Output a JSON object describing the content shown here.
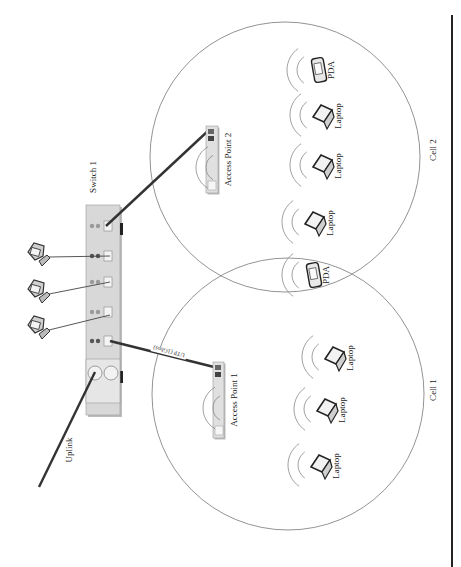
{
  "diagram": {
    "type": "network-topology",
    "orientation": "rotated-90-clockwise",
    "colors": {
      "background": "#ffffff",
      "device_fill": "#d8d8d8",
      "device_stroke": "#999999",
      "cable_thick": "#333333",
      "cable_thin": "#444444",
      "cell_outline": "#777777",
      "wave": "#888888",
      "divider": "#222222"
    },
    "switch": {
      "label": "Switch 1",
      "x": 86,
      "y": 205,
      "w": 34,
      "h": 210
    },
    "uplink": {
      "label": "Uplink",
      "x1": 95,
      "y1": 372,
      "x2": 39,
      "y2": 487
    },
    "access_points": [
      {
        "id": "ap2",
        "label": "Access Point 2",
        "x": 206,
        "y": 126,
        "w": 12,
        "h": 67
      },
      {
        "id": "ap1",
        "label": "Access Point 1",
        "x": 213,
        "y": 362,
        "w": 11,
        "h": 76
      }
    ],
    "cables": [
      {
        "id": "switch-ap2",
        "label": "",
        "x1": 106,
        "y1": 226,
        "x2": 209,
        "y2": 130
      },
      {
        "id": "switch-ap1",
        "label": "UTP (1Gbps)",
        "x1": 110,
        "y1": 341,
        "x2": 218,
        "y2": 368
      }
    ],
    "computers": [
      {
        "id": "pc1",
        "x": 37,
        "y": 255,
        "port_y": 256
      },
      {
        "id": "pc2",
        "x": 37,
        "y": 292,
        "port_y": 282
      },
      {
        "id": "pc3",
        "x": 37,
        "y": 328,
        "port_y": 315
      }
    ],
    "cells": [
      {
        "id": "cell2",
        "label": "Cell 2",
        "cx": 285,
        "cy": 157,
        "r": 135,
        "label_x": 436,
        "label_y": 150
      },
      {
        "id": "cell1",
        "label": "Cell 1",
        "cx": 288,
        "cy": 394,
        "r": 136,
        "label_x": 436,
        "label_y": 390
      }
    ],
    "clients": [
      {
        "type": "pda",
        "label": "PDA",
        "x": 315,
        "y": 70
      },
      {
        "type": "laptop",
        "label": "Laptop",
        "x": 318,
        "y": 115
      },
      {
        "type": "laptop",
        "label": "Laptop",
        "x": 318,
        "y": 165
      },
      {
        "type": "laptop",
        "label": "Laptop",
        "x": 310,
        "y": 222
      },
      {
        "type": "pda",
        "label": "PDA",
        "x": 310,
        "y": 275
      },
      {
        "type": "laptop",
        "label": "Laptop",
        "x": 330,
        "y": 357
      },
      {
        "type": "laptop",
        "label": "Laptop",
        "x": 322,
        "y": 409
      },
      {
        "type": "laptop",
        "label": "Laptop",
        "x": 316,
        "y": 465
      }
    ],
    "divider": {
      "x": 452,
      "y1": 15,
      "y2": 567
    }
  }
}
